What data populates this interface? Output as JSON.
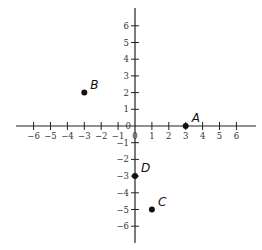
{
  "chart_data": {
    "type": "scatter",
    "title": "",
    "xlabel": "",
    "ylabel": "",
    "xlim": [
      -6.9,
      7.2
    ],
    "ylim": [
      -7,
      7
    ],
    "x_ticks": [
      -6,
      -5,
      -4,
      -3,
      -2,
      -1,
      0,
      1,
      2,
      3,
      4,
      5,
      6
    ],
    "y_ticks": [
      -6,
      -5,
      -4,
      -3,
      -2,
      -1,
      0,
      1,
      2,
      3,
      4,
      5,
      6
    ],
    "x_tick_labels": [
      "−6",
      "−5",
      "−4",
      "−3",
      "−2",
      "−1",
      "0",
      "1",
      "2",
      "3",
      "4",
      "5",
      "6"
    ],
    "y_tick_labels": [
      "−6",
      "−5",
      "−4",
      "−3",
      "−2",
      "−1",
      "0",
      "1",
      "2",
      "3",
      "4",
      "5",
      "6"
    ],
    "grid": false,
    "legend": null,
    "points": [
      {
        "label": "A",
        "x": 3,
        "y": 0
      },
      {
        "label": "B",
        "x": -3,
        "y": 2
      },
      {
        "label": "C",
        "x": 1,
        "y": -5
      },
      {
        "label": "D",
        "x": 0,
        "y": -3
      }
    ]
  },
  "colors": {
    "axis": "#222222",
    "point": "#111111",
    "tick_label": "#333333"
  }
}
